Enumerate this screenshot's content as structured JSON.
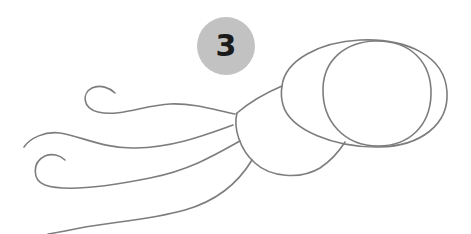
{
  "step": {
    "number": "3",
    "badge_color": "#c2c2c2",
    "text_color": "#1a1a1a"
  },
  "drawing": {
    "subject": "squid sketch",
    "stroke_color": "#7d7d7d",
    "parts": [
      "head-outer-ellipse",
      "head-inner-circle",
      "body-cup",
      "tentacle-top",
      "tentacle-middle",
      "tentacle-lower",
      "tentacle-bottom"
    ]
  }
}
